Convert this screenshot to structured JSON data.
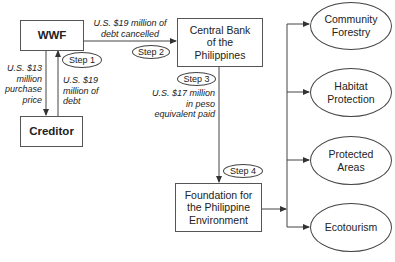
{
  "nodes": {
    "wwf": "WWF",
    "creditor": "Creditor",
    "central_bank": "Central Bank of the Philippines",
    "central_bank_lines": [
      "Central Bank",
      "of the",
      "Philippines"
    ],
    "foundation": "Foundation for the Philippine Environment",
    "foundation_lines": [
      "Foundation for",
      "the Philippine",
      "Environment"
    ]
  },
  "outcomes": [
    {
      "label": "Community Forestry",
      "lines": [
        "Community",
        "Forestry"
      ]
    },
    {
      "label": "Habitat Protection",
      "lines": [
        "Habitat",
        "Protection"
      ]
    },
    {
      "label": "Protected Areas",
      "lines": [
        "Protected",
        "Areas"
      ]
    },
    {
      "label": "Ecotourism",
      "lines": [
        "Ecotourism"
      ]
    }
  ],
  "steps": {
    "step1": "Step 1",
    "step2": "Step 2",
    "step3": "Step 3",
    "step4": "Step 4"
  },
  "edge_labels": {
    "purchase_price": [
      "U.S. $13",
      "million",
      "purchase",
      "price"
    ],
    "debt": [
      "U.S. $19",
      "million of",
      "debt"
    ],
    "debt_cancelled": [
      "U.S. $19 million of",
      "debt cancelled"
    ],
    "peso_paid": [
      "U.S. $17 million",
      "in peso",
      "equivalent paid"
    ]
  },
  "colors": {
    "line": "#444444",
    "text": "#222222",
    "background": "#ffffff"
  }
}
